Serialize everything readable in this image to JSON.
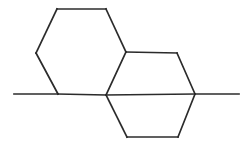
{
  "document": {
    "type": "chemical-structure-diagram",
    "title": "Skeletal structure diagram",
    "background_color": "#ffffff",
    "width": 247,
    "height": 147
  },
  "style": {
    "bond_color": "#2b2b2b",
    "bond_width": 1.7
  },
  "chart_data": {
    "type": "diagram",
    "title": "",
    "subtitle": "",
    "xlabel": "",
    "ylabel": "",
    "notation": "skeletal-formula",
    "atom_labels": [],
    "vertices": [
      {
        "id": "v1",
        "name": "left-ring-top-left",
        "x": 57,
        "y": 9
      },
      {
        "id": "v2",
        "name": "left-ring-top-right",
        "x": 106,
        "y": 9
      },
      {
        "id": "v3",
        "name": "fusion-upper-right",
        "x": 126,
        "y": 52
      },
      {
        "id": "v4",
        "name": "ring-junction-center",
        "x": 106,
        "y": 95
      },
      {
        "id": "v5",
        "name": "ring-junction-left",
        "x": 58,
        "y": 94
      },
      {
        "id": "v6",
        "name": "left-ring-middle-left",
        "x": 36,
        "y": 53
      },
      {
        "id": "v7",
        "name": "right-ring-top-right",
        "x": 177,
        "y": 53
      },
      {
        "id": "v8",
        "name": "ring-junction-right",
        "x": 195,
        "y": 94
      },
      {
        "id": "v9",
        "name": "bottom-ring-bottom-left",
        "x": 127,
        "y": 137
      },
      {
        "id": "v10",
        "name": "bottom-ring-bottom-right",
        "x": 178,
        "y": 137
      },
      {
        "id": "v11",
        "name": "methyl-terminus-left",
        "x": 14,
        "y": 94
      },
      {
        "id": "v12",
        "name": "methyl-terminus-right",
        "x": 239,
        "y": 94
      }
    ],
    "bonds": [
      {
        "name": "bond-v1-v2",
        "from": "v1",
        "to": "v2",
        "order": 1,
        "ring": "left-hexagon"
      },
      {
        "name": "bond-v2-v3",
        "from": "v2",
        "to": "v3",
        "order": 1,
        "ring": "left-hexagon"
      },
      {
        "name": "bond-v3-v4",
        "from": "v3",
        "to": "v4",
        "order": 1,
        "ring": "shared-left-right"
      },
      {
        "name": "bond-v4-v5",
        "from": "v4",
        "to": "v5",
        "order": 1,
        "ring": "left-hexagon"
      },
      {
        "name": "bond-v5-v6",
        "from": "v5",
        "to": "v6",
        "order": 1,
        "ring": "left-hexagon"
      },
      {
        "name": "bond-v6-v1",
        "from": "v6",
        "to": "v1",
        "order": 1,
        "ring": "left-hexagon"
      },
      {
        "name": "bond-v3-v7",
        "from": "v3",
        "to": "v7",
        "order": 1,
        "ring": "right-hexagon"
      },
      {
        "name": "bond-v7-v8",
        "from": "v7",
        "to": "v8",
        "order": 1,
        "ring": "right-hexagon"
      },
      {
        "name": "bond-v8-v4",
        "from": "v8",
        "to": "v4",
        "order": 1,
        "ring": "shared-right-bottom"
      },
      {
        "name": "bond-v4-v9",
        "from": "v4",
        "to": "v9",
        "order": 1,
        "ring": "bottom-hexagon"
      },
      {
        "name": "bond-v9-v10",
        "from": "v9",
        "to": "v10",
        "order": 1,
        "ring": "bottom-hexagon"
      },
      {
        "name": "bond-v10-v8",
        "from": "v10",
        "to": "v8",
        "order": 1,
        "ring": "bottom-hexagon"
      },
      {
        "name": "bond-v5-v11",
        "from": "v5",
        "to": "v11",
        "order": 1,
        "ring": "methyl-left"
      },
      {
        "name": "bond-v8-v12",
        "from": "v8",
        "to": "v12",
        "order": 1,
        "ring": "methyl-right"
      }
    ],
    "rings": [
      {
        "name": "left-hexagon",
        "vertices": [
          "v1",
          "v2",
          "v3",
          "v4",
          "v5",
          "v6"
        ]
      },
      {
        "name": "right-hexagon",
        "vertices": [
          "v3",
          "v7",
          "v8",
          "v4"
        ]
      },
      {
        "name": "bottom-hexagon",
        "vertices": [
          "v4",
          "v8",
          "v10",
          "v9"
        ]
      }
    ],
    "substituents": [
      {
        "name": "methyl-left",
        "attached_to": "v5",
        "terminus": "v11"
      },
      {
        "name": "methyl-right",
        "attached_to": "v8",
        "terminus": "v12"
      }
    ]
  }
}
